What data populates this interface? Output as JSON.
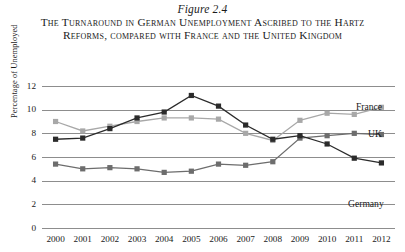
{
  "figure": {
    "number_label": "Figure 2.4",
    "caption": "The Turnaround in German Unemployment Ascribed to the Hartz Reforms, compared with France and the United Kingdom"
  },
  "chart_data": {
    "type": "line",
    "title": "The Turnaround in German Unemployment Ascribed to the Hartz Reforms, compared with France and the United Kingdom",
    "xlabel": "",
    "ylabel": "Percentage of Unemployed",
    "categories": [
      "2000",
      "2001",
      "2002",
      "2003",
      "2004",
      "2005",
      "2006",
      "2007",
      "2008",
      "2009",
      "2010",
      "2011",
      "2012"
    ],
    "ylim": [
      0,
      12
    ],
    "ytick_values": [
      0,
      2,
      4,
      6,
      8,
      10,
      12
    ],
    "ytick_labels": [
      "0",
      "2",
      "4",
      "6",
      "8",
      "10",
      "12"
    ],
    "grid": true,
    "legend_position": "right-inline-labels",
    "series": [
      {
        "name": "Germany",
        "color": "#2b2b2b",
        "label_text": "Germany",
        "values": [
          7.5,
          7.6,
          8.4,
          9.3,
          9.8,
          11.2,
          10.3,
          8.7,
          7.5,
          7.8,
          7.1,
          5.9,
          5.5
        ]
      },
      {
        "name": "France",
        "color": "#a8a8a8",
        "label_text": "France",
        "values": [
          9.0,
          8.2,
          8.6,
          9.0,
          9.3,
          9.3,
          9.2,
          8.0,
          7.4,
          9.1,
          9.7,
          9.6,
          10.2
        ]
      },
      {
        "name": "UK",
        "color": "#6d6d6d",
        "label_text": "UK",
        "values": [
          5.4,
          5.0,
          5.1,
          5.0,
          4.7,
          4.8,
          5.4,
          5.3,
          5.6,
          7.6,
          7.8,
          8.0,
          7.9
        ]
      }
    ]
  },
  "colors": {
    "germany": "#2b2b2b",
    "france": "#a8a8a8",
    "uk": "#6d6d6d",
    "gridline": "#8d8d8d",
    "text": "#1a1a1a",
    "background": "#ffffff"
  }
}
